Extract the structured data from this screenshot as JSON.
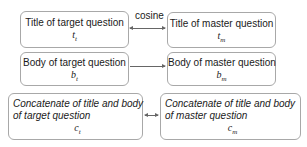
{
  "diagram": {
    "boxes": [
      {
        "id": "title-target",
        "label": "Title of target question",
        "symbol": "t",
        "subscript": "t"
      },
      {
        "id": "title-master",
        "label": "Title of master question",
        "symbol": "t",
        "subscript": "m"
      },
      {
        "id": "body-target",
        "label": "Body of target question",
        "symbol": "b",
        "subscript": "t"
      },
      {
        "id": "body-master",
        "label": "Body of master question",
        "symbol": "b",
        "subscript": "m"
      },
      {
        "id": "concat-target",
        "label_line1": "Concatenate of title and body",
        "label_line2": "of target question",
        "symbol": "c",
        "subscript": "t"
      },
      {
        "id": "concat-master",
        "label_line1": "Concatenate of title and body",
        "label_line2": "of master question",
        "symbol": "c",
        "subscript": "m"
      }
    ],
    "edges": [
      {
        "from": "title-target",
        "to": "title-master",
        "label": "cosine",
        "style": "bidirectional"
      },
      {
        "from": "body-target",
        "to": "body-master",
        "label": "",
        "style": "directed"
      },
      {
        "from": "concat-target",
        "to": "concat-master",
        "label": "",
        "style": "bidirectional"
      }
    ],
    "colors": {
      "border": "#a8a8a8",
      "arrow": "#666666",
      "text": "#1a1a1a"
    }
  }
}
